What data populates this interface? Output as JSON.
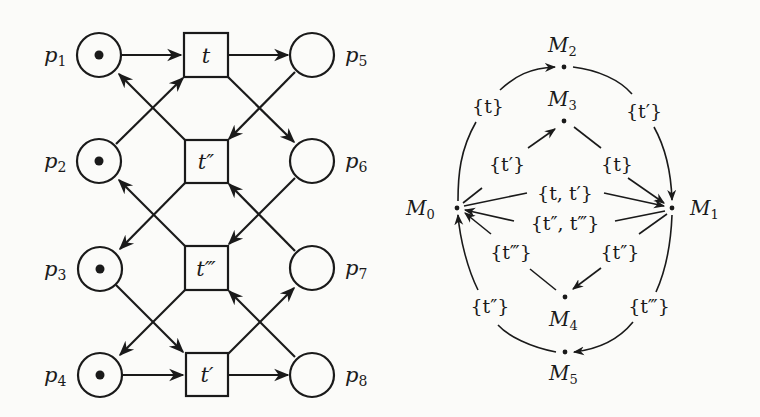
{
  "petri_net": {
    "places": [
      {
        "id": "p1",
        "name": "p",
        "sub": "1",
        "token": true
      },
      {
        "id": "p2",
        "name": "p",
        "sub": "2",
        "token": true
      },
      {
        "id": "p3",
        "name": "p",
        "sub": "3",
        "token": true
      },
      {
        "id": "p4",
        "name": "p",
        "sub": "4",
        "token": true
      },
      {
        "id": "p5",
        "name": "p",
        "sub": "5",
        "token": false
      },
      {
        "id": "p6",
        "name": "p",
        "sub": "6",
        "token": false
      },
      {
        "id": "p7",
        "name": "p",
        "sub": "7",
        "token": false
      },
      {
        "id": "p8",
        "name": "p",
        "sub": "8",
        "token": false
      }
    ],
    "transitions": [
      {
        "id": "t",
        "label": "t"
      },
      {
        "id": "t2",
        "label": "t″"
      },
      {
        "id": "t3",
        "label": "t‴"
      },
      {
        "id": "t1",
        "label": "t′"
      }
    ],
    "arcs": [
      [
        "p1",
        "t"
      ],
      [
        "p2",
        "t"
      ],
      [
        "t",
        "p5"
      ],
      [
        "t",
        "p6"
      ],
      [
        "p5",
        "t2"
      ],
      [
        "p7",
        "t2"
      ],
      [
        "t2",
        "p1"
      ],
      [
        "t2",
        "p3"
      ],
      [
        "p6",
        "t3"
      ],
      [
        "p8",
        "t3"
      ],
      [
        "t3",
        "p2"
      ],
      [
        "t3",
        "p4"
      ],
      [
        "p3",
        "t1"
      ],
      [
        "p4",
        "t1"
      ],
      [
        "t1",
        "p7"
      ],
      [
        "t1",
        "p8"
      ]
    ]
  },
  "reachability_graph": {
    "markings": [
      {
        "id": "M0",
        "name": "M",
        "sub": "0"
      },
      {
        "id": "M1",
        "name": "M",
        "sub": "1"
      },
      {
        "id": "M2",
        "name": "M",
        "sub": "2"
      },
      {
        "id": "M3",
        "name": "M",
        "sub": "3"
      },
      {
        "id": "M4",
        "name": "M",
        "sub": "4"
      },
      {
        "id": "M5",
        "name": "M",
        "sub": "5"
      }
    ],
    "edge_labels": {
      "m0_m2": "{t}",
      "m2_m1": "{t′}",
      "m0_m3": "{t′}",
      "m3_m1": "{t}",
      "m0_m1": "{t, t′}",
      "m1_m0": "{t″, t‴}",
      "m4_m0": "{t‴}",
      "m1_m4": "{t″}",
      "m5_m0": "{t″}",
      "m1_m5": "{t‴}"
    }
  }
}
